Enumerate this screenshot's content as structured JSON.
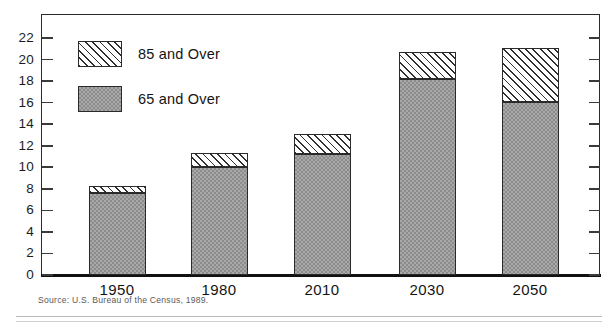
{
  "chart_data": {
    "type": "bar",
    "subtype": "stacked-vertical",
    "title": "",
    "xlabel": "",
    "ylabel": "",
    "categories": [
      "1950",
      "1980",
      "2010",
      "2030",
      "2050"
    ],
    "series": [
      {
        "name": "65 and Over",
        "values": [
          7.6,
          10.0,
          11.2,
          18.2,
          16.1
        ],
        "fill": "stippled-gray"
      },
      {
        "name": "85 and Over",
        "values": [
          0.7,
          1.3,
          1.9,
          2.5,
          5.0
        ],
        "fill": "diagonal-hatch"
      }
    ],
    "totals": [
      8.3,
      11.3,
      13.1,
      20.7,
      21.1
    ],
    "ylim": [
      0,
      22
    ],
    "ytick_step": 2,
    "yticks": [
      "0",
      "2",
      "4",
      "6",
      "8",
      "10",
      "12",
      "14",
      "16",
      "18",
      "20",
      "22"
    ],
    "grid": false,
    "legend_position": "inside-top-left",
    "ticks_mirrored_right": true,
    "frame": true
  },
  "legend": {
    "entries": [
      {
        "label": "85 and Over",
        "fill": "diagonal-hatch"
      },
      {
        "label": "65 and Over",
        "fill": "stippled-gray"
      }
    ]
  },
  "footer": {
    "source": "Source: U.S. Bureau of the Census, 1989."
  },
  "colors": {
    "axis": "#2b2b2b",
    "baseline": "#111111",
    "bar_65_fill": "#a8a8a8",
    "bar_85_fill": "#ffffff",
    "hatch_stroke": "#2f2f2f",
    "text": "#141414",
    "source_text": "#5a5a5a",
    "rule": "#b9b9b9"
  }
}
